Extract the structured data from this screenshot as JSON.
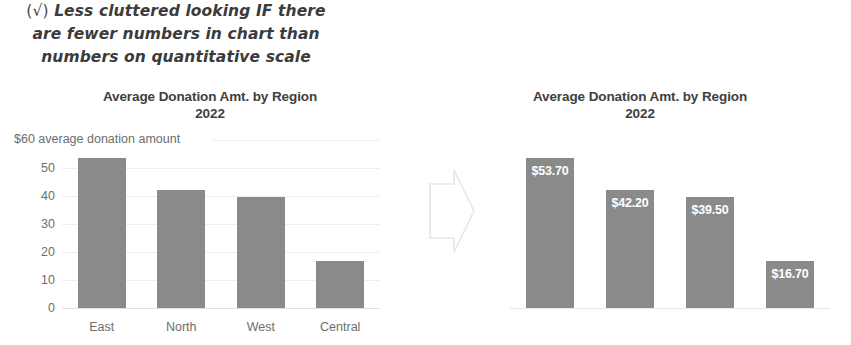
{
  "annotation": {
    "icon": "check-mark-in-parentheses",
    "check_glyph": "(√)",
    "line1": "Less cluttered looking IF there",
    "line2": "are fewer numbers in chart than",
    "line3": "numbers on quantitative scale"
  },
  "colors": {
    "bar": "#8a8a8a",
    "title_text": "#404040",
    "axis_text": "#6e6e6e",
    "gridline": "#eeeeee",
    "value_label_text": "#ffffff",
    "annotation_text": "#3b3b3b",
    "background": "#ffffff"
  },
  "chart_data": [
    {
      "id": "left-chart",
      "type": "bar",
      "title": "Average Donation Amt. by Region",
      "subtitle": "2022",
      "title_line1": "Average Donation Amt. by Region",
      "title_line2": "2022",
      "categories": [
        "East",
        "North",
        "West",
        "Central"
      ],
      "values": [
        53.7,
        42.2,
        39.5,
        16.7
      ],
      "xlabel": "",
      "ylabel": "average donation amount",
      "axis_top_label": "$60",
      "axis_caption": "average donation amount",
      "ylim": [
        0,
        60
      ],
      "yticks": [
        "$60",
        "50",
        "40",
        "30",
        "20",
        "10",
        "0"
      ],
      "ytick_values": [
        60,
        50,
        40,
        30,
        20,
        10,
        0
      ],
      "grid": true,
      "data_labels": false,
      "legend": "none"
    },
    {
      "id": "right-chart",
      "type": "bar",
      "title": "Average Donation Amt. by Region",
      "subtitle": "2022",
      "title_line1": "Average Donation Amt. by Region",
      "title_line2": "2022",
      "categories": [
        "East",
        "North",
        "West",
        "Central"
      ],
      "values": [
        53.7,
        42.2,
        39.5,
        16.7
      ],
      "data_label_text": [
        "$53.70",
        "$42.20",
        "$39.50",
        "$16.70"
      ],
      "xlabel": "",
      "ylabel": "",
      "ylim": [
        0,
        60
      ],
      "yticks": [],
      "grid": false,
      "data_labels": true,
      "legend": "none"
    }
  ],
  "arrow": {
    "icon": "right-arrow-outline"
  }
}
